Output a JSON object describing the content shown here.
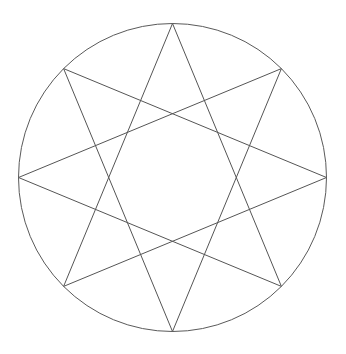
{
  "figure": {
    "background_color": "#ffffff",
    "canvas": {
      "width": 346,
      "height": 354
    }
  },
  "chart_data": {
    "type": "diagram",
    "subtype": "star-polygon",
    "title": "",
    "schlafli_symbol": "{8/3}",
    "vertex_count": 8,
    "step": 3,
    "circle": {
      "center_x": 172.5,
      "center_y": 177.5,
      "radius": 154,
      "stroke": "#5a5a5a",
      "stroke_width": 1,
      "fill": "none"
    },
    "star": {
      "stroke": "#555555",
      "stroke_width": 1,
      "fill": "none"
    },
    "vertex_angles_deg": [
      -90,
      -45,
      0,
      45,
      90,
      135,
      180,
      225
    ],
    "vertices": [
      {
        "name": "top",
        "index": 0,
        "x": 172.5,
        "y": 23.5
      },
      {
        "name": "upper-right",
        "index": 1,
        "x": 281.4,
        "y": 68.6
      },
      {
        "name": "right",
        "index": 2,
        "x": 326.5,
        "y": 177.5
      },
      {
        "name": "lower-right",
        "index": 3,
        "x": 281.4,
        "y": 286.4
      },
      {
        "name": "bottom",
        "index": 4,
        "x": 172.5,
        "y": 331.5
      },
      {
        "name": "lower-left",
        "index": 5,
        "x": 63.6,
        "y": 286.4
      },
      {
        "name": "left",
        "index": 6,
        "x": 18.5,
        "y": 177.5
      },
      {
        "name": "upper-left",
        "index": 7,
        "x": 63.6,
        "y": 68.6
      }
    ],
    "edges": [
      {
        "from": 0,
        "to": 3
      },
      {
        "from": 3,
        "to": 6
      },
      {
        "from": 6,
        "to": 1
      },
      {
        "from": 1,
        "to": 4
      },
      {
        "from": 4,
        "to": 7
      },
      {
        "from": 7,
        "to": 2
      },
      {
        "from": 2,
        "to": 5
      },
      {
        "from": 5,
        "to": 0
      }
    ],
    "legend": [],
    "annotations": [],
    "grid": false,
    "axes": false
  }
}
